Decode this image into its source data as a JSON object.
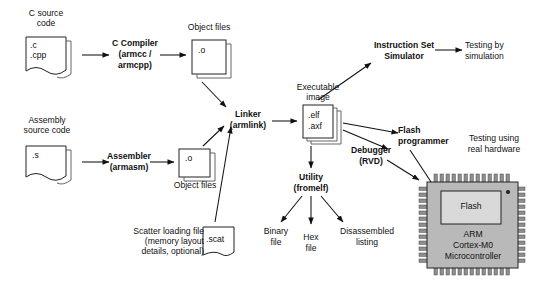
{
  "diagram": {
    "nodes": {
      "c_source_caption": "C source\ncode",
      "c_source_ext": ".c\n.cpp",
      "c_compiler": "C Compiler\n(armcc /\narmcpp)",
      "object_files_top": "Object files",
      "object_ext_top": ".o",
      "asm_source_caption": "Assembly\nsource code",
      "asm_source_ext": ".s",
      "assembler": "Assembler\n(armasm)",
      "object_files_bottom": "Object files",
      "object_ext_bottom": ".o",
      "scatter_caption": "Scatter loading file\n(memory layout\ndetails, optional)",
      "scatter_ext": ".scat",
      "linker": "Linker\n(armlink)",
      "exec_image_caption": "Executable\nimage",
      "exec_image_ext": ".elf\n.axf",
      "iss": "Instruction Set\nSimulator",
      "testing_sim": "Testing by\nsimulation",
      "flash_programmer": "Flash\nprogrammer",
      "debugger": "Debugger\n(RVD)",
      "testing_hw": "Testing using\nreal hardware",
      "utility": "Utility\n(fromelf)",
      "binary_file": "Binary\nfile",
      "hex_file": "Hex\nfile",
      "disassembled_listing": "Disassembled\nlisting",
      "chip_flash": "Flash",
      "chip_name": "ARM\nCortex-M0\nMicrocontroller"
    },
    "colors": {
      "line": "#111111",
      "paper_fill": "#ffffff",
      "chip_body": "#b9b9b9",
      "chip_pin": "#8e8e8e",
      "flash_block": "#d9d9d9"
    }
  }
}
